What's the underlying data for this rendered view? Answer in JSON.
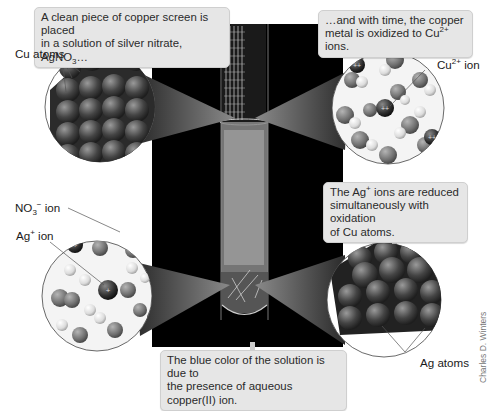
{
  "figure": {
    "callouts": {
      "top_left": {
        "line1": "A clean piece of copper screen is placed",
        "line2_pre": "in a solution of silver nitrate, AgNO",
        "line2_sub": "3",
        "line2_post": "…"
      },
      "top_right": {
        "line1": "…and with time, the copper",
        "line2_pre": "metal is oxidized to Cu",
        "line2_sup": "2+",
        "line2_post": " ions."
      },
      "mid_right": {
        "line1_pre": "The Ag",
        "line1_sup": "+",
        "line1_post": " ions are reduced",
        "line2": "simultaneously with oxidation",
        "line3": "of Cu atoms."
      },
      "bottom": {
        "line1": "The blue color of the solution is due to",
        "line2": "the presence of aqueous copper(II) ion."
      }
    },
    "labels": {
      "cu_atoms": "Cu atoms",
      "cu_ion_pre": "Cu",
      "cu_ion_sup": "2+",
      "cu_ion_post": " ion",
      "no3_pre": "NO",
      "no3_sub": "3",
      "no3_sup": "−",
      "no3_post": " ion",
      "ag_ion_pre": "Ag",
      "ag_ion_sup": "+",
      "ag_ion_post": " ion",
      "ag_atoms": "Ag atoms"
    },
    "credit": "Charles D. Winters",
    "colors": {
      "callout_bg": "#e6e6e6",
      "photo_bg": "#000000",
      "atom_dark": "#3a3a3a",
      "atom_mid": "#7a7a7a",
      "cone": "#555555"
    }
  }
}
